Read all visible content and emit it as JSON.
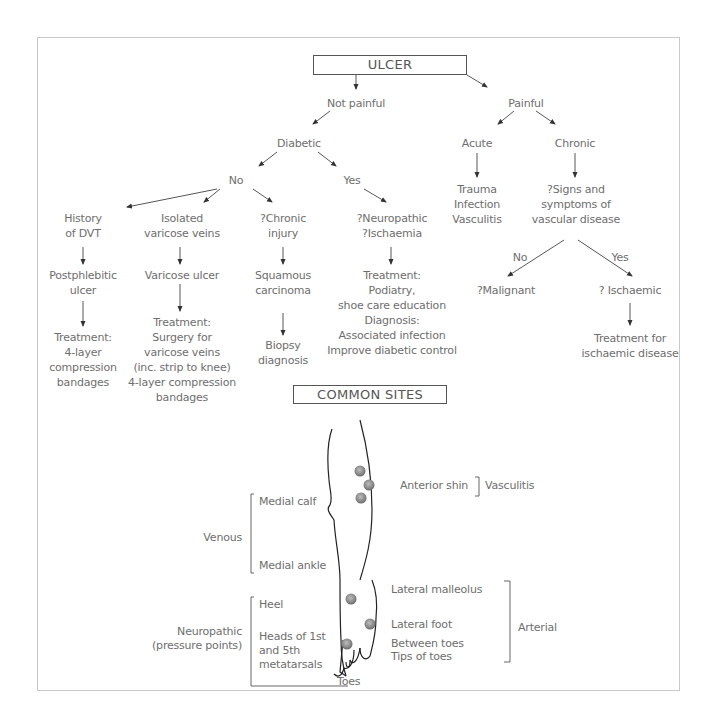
{
  "diagram": {
    "title": "ULCER",
    "sites_title": "COMMON SITES",
    "colors": {
      "line": "#444444",
      "text": "#6e6e6e",
      "frame": "#c8c8c8",
      "ulcer_dot": "#8a8a8a"
    },
    "flow": {
      "not_painful": "Not painful",
      "painful": "Painful",
      "diabetic": "Diabetic",
      "no": "No",
      "yes": "Yes",
      "acute": "Acute",
      "chronic": "Chronic",
      "acute_causes": [
        "Trauma",
        "Infection",
        "Vasculitis"
      ],
      "chronic_question": [
        "?Signs and",
        "symptoms of",
        "vascular disease"
      ],
      "vascular_no": "No",
      "vascular_yes": "Yes",
      "malignant": "?Malignant",
      "ischaemic": "? Ischaemic",
      "ischaemic_treatment": [
        "Treatment for",
        "ischaemic disease"
      ],
      "dvt": {
        "cause": [
          "History",
          "of DVT"
        ],
        "result": [
          "Postphlebitic",
          "ulcer"
        ],
        "treatment": [
          "Treatment:",
          "4-layer",
          "compression",
          "bandages"
        ]
      },
      "varicose": {
        "cause": [
          "Isolated",
          "varicose veins"
        ],
        "result": [
          "Varicose ulcer"
        ],
        "treatment": [
          "Treatment:",
          "Surgery for",
          "varicose veins",
          "(inc. strip to knee)",
          "4-layer compression",
          "bandages"
        ]
      },
      "chronic_injury": {
        "cause": [
          "?Chronic",
          "injury"
        ],
        "result": [
          "Squamous",
          "carcinoma"
        ],
        "treatment": [
          "Biopsy",
          "diagnosis"
        ]
      },
      "diabetic_yes": {
        "cause": [
          "?Neuropathic",
          "?Ischaemia"
        ],
        "treatment": [
          "Treatment:",
          "Podiatry,",
          "shoe care education",
          "Diagnosis:",
          "Associated infection",
          "Improve diabetic control"
        ]
      }
    },
    "sites": {
      "anterior_shin": "Anterior shin",
      "vasculitis": "Vasculitis",
      "medial_calf": "Medial calf",
      "venous": "Venous",
      "medial_ankle": "Medial ankle",
      "lateral_malleolus": "Lateral malleolus",
      "lateral_foot": "Lateral foot",
      "between_toes": "Between toes",
      "tips_of_toes": "Tips of toes",
      "arterial": "Arterial",
      "heel": "Heel",
      "neuropathic": [
        "Neuropathic",
        "(pressure points)"
      ],
      "metatarsals": [
        "Heads of 1st",
        "and 5th",
        "metatarsals"
      ],
      "toes": "Toes"
    }
  }
}
